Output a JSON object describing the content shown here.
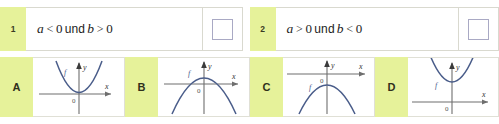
{
  "statements": [
    {
      "index": "1",
      "var1": "a",
      "rel1": "<",
      "num1": "0",
      "conj": "und",
      "var2": "b",
      "rel2": ">",
      "num2": "0",
      "checkbox_value": ""
    },
    {
      "index": "2",
      "var1": "a",
      "rel1": ">",
      "num1": "0",
      "conj": "und",
      "var2": "b",
      "rel2": "<",
      "num2": "0",
      "checkbox_value": ""
    }
  ],
  "graphs": [
    {
      "letter": "A",
      "curve_label": "f",
      "x_axis_label": "x",
      "y_axis_label": "y",
      "origin_label": "0",
      "shape": "parabola-up-vertex-below-axis"
    },
    {
      "letter": "B",
      "curve_label": "f",
      "x_axis_label": "x",
      "y_axis_label": "y",
      "origin_label": "0",
      "shape": "parabola-down-vertex-above-axis"
    },
    {
      "letter": "C",
      "curve_label": "f",
      "x_axis_label": "x",
      "y_axis_label": "y",
      "origin_label": "0",
      "shape": "parabola-down-vertex-on-axis"
    },
    {
      "letter": "D",
      "curve_label": "f",
      "x_axis_label": "x",
      "y_axis_label": "y",
      "origin_label": "0",
      "shape": "parabola-up-vertex-above-axis"
    }
  ],
  "colors": {
    "badge_green": "#e6f29a",
    "curve_blue": "#4a5d8a",
    "axis_gray": "#6e6e6e",
    "card_border": "#d9d9cf",
    "checkbox_border": "#a9a9c4"
  }
}
